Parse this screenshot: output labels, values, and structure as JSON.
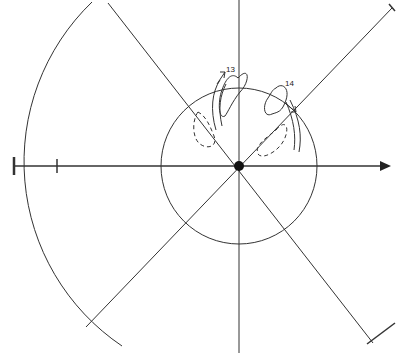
{
  "diagram": {
    "type": "polar-radiation-pattern-sketch",
    "background": "#ffffff",
    "stroke_color": "#333333",
    "center": {
      "x": 239,
      "y": 166,
      "marker": "filled-dot"
    },
    "inner_circle_radius": 78,
    "outer_arc_radius": 225,
    "axes": [
      "horizontal-with-arrow",
      "vertical",
      "diagonal-45",
      "diagonal-135"
    ],
    "scale_ticks": [
      {
        "x": 14
      },
      {
        "x": 56
      }
    ],
    "loops": [
      {
        "id": "loop-13",
        "label": "13",
        "style": "solid-and-dashed"
      },
      {
        "id": "loop-14",
        "label": "14",
        "style": "solid-and-dashed"
      }
    ]
  }
}
